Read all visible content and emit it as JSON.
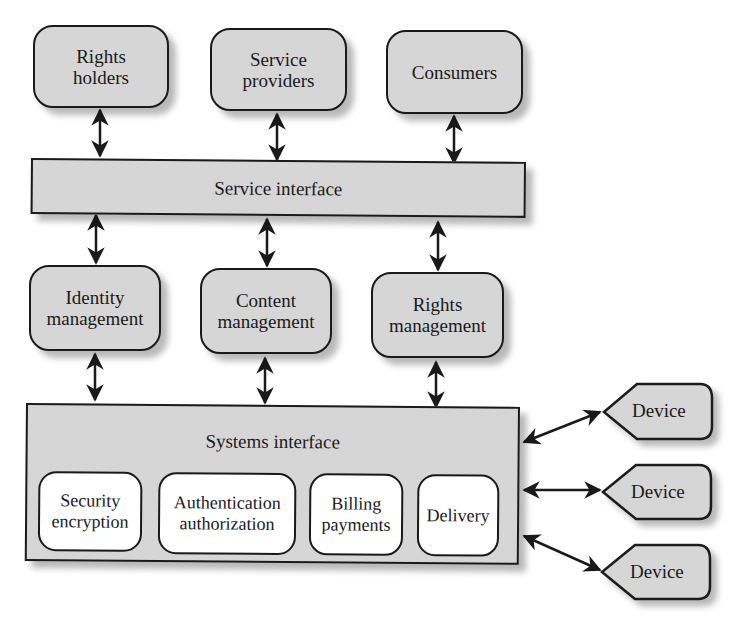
{
  "diagram": {
    "top_row": [
      {
        "id": "rights-holders",
        "label": "Rights\nholders"
      },
      {
        "id": "service-providers",
        "label": "Service\nproviders"
      },
      {
        "id": "consumers",
        "label": "Consumers"
      }
    ],
    "service_interface": {
      "label": "Service interface"
    },
    "middle_row": [
      {
        "id": "identity-management",
        "label": "Identity\nmanagement"
      },
      {
        "id": "content-management",
        "label": "Content\nmanagement"
      },
      {
        "id": "rights-management",
        "label": "Rights\nmanagement"
      }
    ],
    "systems_interface": {
      "label": "Systems interface",
      "modules": [
        {
          "id": "security-encryption",
          "label": "Security\nencryption"
        },
        {
          "id": "authentication-authorization",
          "label": "Authentication\nauthorization"
        },
        {
          "id": "billing-payments",
          "label": "Billing\npayments"
        },
        {
          "id": "delivery",
          "label": "Delivery"
        }
      ]
    },
    "devices": [
      {
        "id": "device-1",
        "label": "Device"
      },
      {
        "id": "device-2",
        "label": "Device"
      },
      {
        "id": "device-3",
        "label": "Device"
      }
    ],
    "connections": [
      {
        "from": "rights-holders",
        "to": "service-interface",
        "type": "bidirectional"
      },
      {
        "from": "service-providers",
        "to": "service-interface",
        "type": "bidirectional"
      },
      {
        "from": "consumers",
        "to": "service-interface",
        "type": "bidirectional"
      },
      {
        "from": "service-interface",
        "to": "identity-management",
        "type": "bidirectional"
      },
      {
        "from": "service-interface",
        "to": "content-management",
        "type": "bidirectional"
      },
      {
        "from": "service-interface",
        "to": "rights-management",
        "type": "bidirectional"
      },
      {
        "from": "identity-management",
        "to": "systems-interface",
        "type": "bidirectional"
      },
      {
        "from": "content-management",
        "to": "systems-interface",
        "type": "bidirectional"
      },
      {
        "from": "rights-management",
        "to": "systems-interface",
        "type": "bidirectional"
      },
      {
        "from": "systems-interface",
        "to": "device-1",
        "type": "bidirectional"
      },
      {
        "from": "systems-interface",
        "to": "device-2",
        "type": "bidirectional"
      },
      {
        "from": "systems-interface",
        "to": "device-3",
        "type": "bidirectional"
      }
    ],
    "colors": {
      "box_fill": "#d6d6d6",
      "inner_fill": "#ffffff",
      "stroke": "#1a1a1a"
    }
  }
}
